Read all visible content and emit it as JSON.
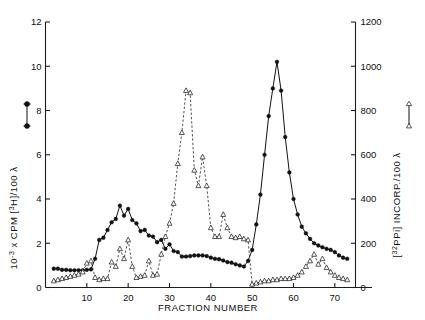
{
  "figure": {
    "background": "#ffffff",
    "width": 425,
    "height": 320
  },
  "axes": {
    "x": {
      "title": "FRACTION  NUMBER",
      "ticks": [
        10,
        20,
        30,
        40,
        50,
        60,
        70
      ],
      "tick_labels": [
        "10",
        "20",
        "30",
        "40",
        "50",
        "60",
        "70"
      ],
      "range": [
        0,
        75
      ]
    },
    "y_left": {
      "title_prefix": "10",
      "title_exponent": "-3",
      "title_mid": " x CPM  [",
      "title_sup": "3",
      "title_suffix": "H]/100 λ",
      "title_plain": "10-3 x CPM  [3H]/100 λ",
      "ticks": [
        0,
        2,
        4,
        6,
        8,
        10,
        12
      ],
      "tick_labels": [
        "0",
        "2",
        "4",
        "6",
        "8",
        "10",
        "12"
      ],
      "range": [
        0,
        12
      ],
      "legend_marker": "filled-circle"
    },
    "y_right": {
      "title_sup": "32",
      "title_prefix": "[",
      "title_mid": "PPi]  INCORP./100 λ",
      "title_plain": "[32PPi] INCORP./100 λ",
      "ticks": [
        0,
        200,
        400,
        600,
        800,
        1000,
        1200
      ],
      "tick_labels": [
        "0",
        "200",
        "400",
        "600",
        "800",
        "1000",
        "1200"
      ],
      "range": [
        0,
        1200
      ],
      "legend_marker": "open-triangle"
    }
  },
  "colors": {
    "ink": "#111111",
    "axis": "#1d1d1d",
    "paper": "#ffffff"
  },
  "chart_data": {
    "type": "line",
    "title": "",
    "subtitle": "",
    "xlabel": "FRACTION  NUMBER",
    "ylabel": "10-3 x CPM [3H]/100 λ",
    "ylabel_right": "[32PPi] INCORP./100 λ",
    "xlim": [
      0,
      75
    ],
    "ylim": [
      0,
      12
    ],
    "ylim_right": [
      0,
      1200
    ],
    "grid": false,
    "legend_position": "axis-inline",
    "series": [
      {
        "name": "[3H] CPM / 100 λ",
        "marker": "filled-circle",
        "linestyle": "solid",
        "axis": "left",
        "x": [
          2,
          3,
          4,
          5,
          6,
          7,
          8,
          9,
          10,
          11,
          12,
          13,
          14,
          15,
          16,
          17,
          18,
          19,
          20,
          21,
          22,
          23,
          24,
          25,
          26,
          27,
          28,
          29,
          30,
          31,
          32,
          33,
          34,
          35,
          36,
          37,
          38,
          39,
          40,
          41,
          42,
          43,
          44,
          45,
          46,
          47,
          48,
          49,
          50,
          51,
          52,
          53,
          54,
          55,
          56,
          57,
          58,
          59,
          60,
          61,
          62,
          63,
          64,
          65,
          66,
          67,
          68,
          69,
          70,
          71,
          72,
          73
        ],
        "y": [
          0.85,
          0.85,
          0.8,
          0.8,
          0.78,
          0.78,
          0.78,
          0.78,
          0.8,
          0.82,
          1.3,
          2.15,
          2.25,
          2.6,
          2.95,
          3.1,
          3.7,
          3.25,
          3.55,
          3.05,
          2.9,
          2.55,
          2.6,
          2.35,
          2.3,
          2.05,
          2.15,
          1.75,
          1.95,
          1.65,
          1.6,
          1.4,
          1.4,
          1.42,
          1.45,
          1.45,
          1.45,
          1.42,
          1.35,
          1.3,
          1.28,
          1.22,
          1.15,
          1.12,
          1.05,
          1.0,
          0.95,
          1.2,
          1.7,
          2.85,
          4.2,
          6.0,
          7.75,
          9.0,
          10.2,
          8.9,
          6.8,
          5.2,
          4.0,
          3.3,
          2.75,
          2.45,
          2.2,
          2.0,
          1.9,
          1.82,
          1.75,
          1.7,
          1.6,
          1.45,
          1.35,
          1.3
        ]
      },
      {
        "name": "[32PPi] INCORP. / 100 λ",
        "marker": "open-triangle",
        "linestyle": "dashed",
        "axis": "right",
        "x": [
          2,
          3,
          4,
          5,
          6,
          7,
          8,
          9,
          10,
          11,
          12,
          13,
          14,
          15,
          16,
          17,
          18,
          19,
          20,
          21,
          22,
          23,
          24,
          25,
          26,
          27,
          28,
          29,
          30,
          31,
          32,
          33,
          34,
          35,
          36,
          37,
          38,
          39,
          40,
          41,
          42,
          43,
          44,
          45,
          46,
          47,
          48,
          49,
          50,
          51,
          52,
          53,
          54,
          55,
          56,
          57,
          58,
          59,
          60,
          61,
          62,
          63,
          64,
          65,
          66,
          67,
          68,
          69,
          70,
          71,
          72,
          73
        ],
        "y": [
          30,
          35,
          40,
          45,
          50,
          55,
          60,
          70,
          110,
          120,
          45,
          35,
          40,
          40,
          115,
          95,
          175,
          130,
          215,
          95,
          45,
          50,
          55,
          120,
          55,
          60,
          150,
          230,
          290,
          380,
          560,
          700,
          890,
          880,
          530,
          460,
          590,
          460,
          270,
          230,
          230,
          330,
          270,
          230,
          225,
          230,
          220,
          215,
          15,
          20,
          25,
          30,
          30,
          35,
          35,
          40,
          40,
          40,
          45,
          55,
          70,
          95,
          120,
          150,
          105,
          130,
          90,
          70,
          55,
          45,
          40,
          35
        ]
      }
    ]
  }
}
